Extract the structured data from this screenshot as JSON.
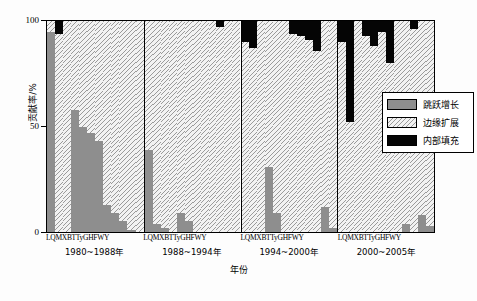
{
  "chart_data": {
    "type": "bar",
    "subtype": "stacked-percentage",
    "title": "",
    "xlabel": "年份",
    "ylabel": "贡献率/%",
    "ylim": [
      0,
      100
    ],
    "yticks": [
      0,
      50,
      100
    ],
    "grid": false,
    "legend_position": "right-inside",
    "categories": [
      "L",
      "Q",
      "M",
      "X",
      "B",
      "T",
      "Ty",
      "G",
      "H",
      "F",
      "W",
      "Y",
      "L",
      "Q",
      "M",
      "X",
      "B",
      "T",
      "Ty",
      "G",
      "H",
      "F",
      "W",
      "Y",
      "L",
      "Q",
      "M",
      "X",
      "B",
      "T",
      "Ty",
      "G",
      "H",
      "F",
      "W",
      "Y",
      "L",
      "Q",
      "M",
      "X",
      "B",
      "T",
      "Ty",
      "G",
      "H",
      "F",
      "W",
      "Y"
    ],
    "group_label_text": "LQMXBTTyGHFWY",
    "groups": [
      {
        "period": "1980~1988年",
        "tick_label": "LQMXBTTyGHFWY",
        "bars": [
          {
            "name": "L",
            "leap": 95,
            "edge": 5,
            "inner": 0
          },
          {
            "name": "Q",
            "leap": 0,
            "edge": 94,
            "inner": 6
          },
          {
            "name": "M",
            "leap": 0,
            "edge": 100,
            "inner": 0
          },
          {
            "name": "X",
            "leap": 58,
            "edge": 42,
            "inner": 0
          },
          {
            "name": "B",
            "leap": 50,
            "edge": 50,
            "inner": 0
          },
          {
            "name": "T",
            "leap": 47,
            "edge": 53,
            "inner": 0
          },
          {
            "name": "Ty",
            "leap": 43,
            "edge": 57,
            "inner": 0
          },
          {
            "name": "G",
            "leap": 13,
            "edge": 87,
            "inner": 0
          },
          {
            "name": "H",
            "leap": 9,
            "edge": 91,
            "inner": 0
          },
          {
            "name": "F",
            "leap": 5,
            "edge": 95,
            "inner": 0
          },
          {
            "name": "W",
            "leap": 1,
            "edge": 99,
            "inner": 0
          },
          {
            "name": "Y",
            "leap": 0,
            "edge": 100,
            "inner": 0
          }
        ]
      },
      {
        "period": "1988~1994年",
        "tick_label": "LQMXBTTyGHFWY",
        "bars": [
          {
            "name": "L",
            "leap": 39,
            "edge": 61,
            "inner": 0
          },
          {
            "name": "Q",
            "leap": 4,
            "edge": 96,
            "inner": 0
          },
          {
            "name": "M",
            "leap": 2,
            "edge": 98,
            "inner": 0
          },
          {
            "name": "X",
            "leap": 0,
            "edge": 100,
            "inner": 0
          },
          {
            "name": "B",
            "leap": 9,
            "edge": 91,
            "inner": 0
          },
          {
            "name": "T",
            "leap": 5,
            "edge": 95,
            "inner": 0
          },
          {
            "name": "Ty",
            "leap": 0,
            "edge": 100,
            "inner": 0
          },
          {
            "name": "G",
            "leap": 0,
            "edge": 100,
            "inner": 0
          },
          {
            "name": "H",
            "leap": 0,
            "edge": 100,
            "inner": 0
          },
          {
            "name": "F",
            "leap": 0,
            "edge": 97,
            "inner": 3
          },
          {
            "name": "W",
            "leap": 0,
            "edge": 100,
            "inner": 0
          },
          {
            "name": "Y",
            "leap": 0,
            "edge": 100,
            "inner": 0
          }
        ]
      },
      {
        "period": "1994~2000年",
        "tick_label": "LQMXBTTyGHFWY",
        "bars": [
          {
            "name": "L",
            "leap": 0,
            "edge": 90,
            "inner": 10
          },
          {
            "name": "Q",
            "leap": 0,
            "edge": 87,
            "inner": 13
          },
          {
            "name": "M",
            "leap": 0,
            "edge": 100,
            "inner": 0
          },
          {
            "name": "X",
            "leap": 31,
            "edge": 69,
            "inner": 0
          },
          {
            "name": "B",
            "leap": 9,
            "edge": 91,
            "inner": 0
          },
          {
            "name": "T",
            "leap": 0,
            "edge": 100,
            "inner": 0
          },
          {
            "name": "Ty",
            "leap": 0,
            "edge": 94,
            "inner": 6
          },
          {
            "name": "G",
            "leap": 0,
            "edge": 93,
            "inner": 7
          },
          {
            "name": "H",
            "leap": 0,
            "edge": 91,
            "inner": 9
          },
          {
            "name": "F",
            "leap": 0,
            "edge": 86,
            "inner": 14
          },
          {
            "name": "W",
            "leap": 12,
            "edge": 88,
            "inner": 0
          },
          {
            "name": "Y",
            "leap": 2,
            "edge": 98,
            "inner": 0
          }
        ]
      },
      {
        "period": "2000~2005年",
        "tick_label": "LQMXBTTyGHFWY",
        "bars": [
          {
            "name": "L",
            "leap": 0,
            "edge": 90,
            "inner": 10
          },
          {
            "name": "Q",
            "leap": 0,
            "edge": 52,
            "inner": 48
          },
          {
            "name": "M",
            "leap": 0,
            "edge": 100,
            "inner": 0
          },
          {
            "name": "X",
            "leap": 0,
            "edge": 93,
            "inner": 7
          },
          {
            "name": "B",
            "leap": 0,
            "edge": 88,
            "inner": 12
          },
          {
            "name": "T",
            "leap": 0,
            "edge": 95,
            "inner": 5
          },
          {
            "name": "Ty",
            "leap": 0,
            "edge": 80,
            "inner": 20
          },
          {
            "name": "G",
            "leap": 0,
            "edge": 100,
            "inner": 0
          },
          {
            "name": "H",
            "leap": 4,
            "edge": 96,
            "inner": 0
          },
          {
            "name": "F",
            "leap": 0,
            "edge": 96,
            "inner": 4
          },
          {
            "name": "W",
            "leap": 8,
            "edge": 92,
            "inner": 0
          },
          {
            "name": "Y",
            "leap": 3,
            "edge": 97,
            "inner": 0
          }
        ]
      }
    ],
    "legend": [
      {
        "key": "leap",
        "label": "跳跃增长",
        "color": "#8e8e8e",
        "pattern": "solid-gray"
      },
      {
        "key": "edge",
        "label": "边缘扩展",
        "color": "#f2f2f2",
        "pattern": "diagonal-hatch"
      },
      {
        "key": "inner",
        "label": "内部填充",
        "color": "#050505",
        "pattern": "solid-black"
      }
    ]
  },
  "axis": {
    "y_ticks": [
      "0",
      "50",
      "100"
    ],
    "y_title": "贡献率/%",
    "x_title": "年份"
  }
}
